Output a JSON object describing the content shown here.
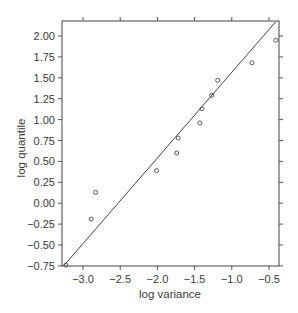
{
  "chart_data": {
    "type": "scatter",
    "title": "",
    "xlabel": "log variance",
    "ylabel": "log quantile",
    "xlim": [
      -3.26,
      -0.39
    ],
    "ylim": [
      -0.75,
      2.17
    ],
    "xticks": [
      -3.0,
      -2.5,
      -2.0,
      -1.5,
      -1.0,
      -0.5
    ],
    "xtick_labels": [
      "−3.0",
      "−2.5",
      "−2.0",
      "−1.5",
      "−1.0",
      "−0.5"
    ],
    "yticks": [
      2.0,
      1.75,
      1.5,
      1.25,
      1.0,
      0.75,
      0.5,
      0.25,
      0.0,
      -0.25,
      -0.5,
      -0.75
    ],
    "ytick_labels": [
      "2.00",
      "1.75",
      "1.50",
      "1.25",
      "1.00",
      "0.75",
      "0.50",
      "0.25",
      "0.00",
      "−0.25",
      "−0.50",
      "−0.75"
    ],
    "grid": false,
    "legend": null,
    "series": [
      {
        "name": "observations",
        "marker": "open-circle",
        "x": [
          -3.23,
          -2.89,
          -2.83,
          -2.01,
          -1.74,
          -1.72,
          -1.43,
          -1.4,
          -1.27,
          -1.19,
          -0.73,
          -0.41
        ],
        "y": [
          -0.74,
          -0.19,
          0.13,
          0.39,
          0.6,
          0.78,
          0.96,
          1.13,
          1.29,
          1.47,
          1.68,
          1.95
        ]
      },
      {
        "name": "reference line",
        "type": "line",
        "x": [
          -3.26,
          -0.41
        ],
        "y": [
          -0.75,
          2.17
        ]
      }
    ]
  },
  "colors": {
    "axis": "#555555",
    "text": "#3a3a3a",
    "points": "#444444",
    "line": "#444444"
  }
}
